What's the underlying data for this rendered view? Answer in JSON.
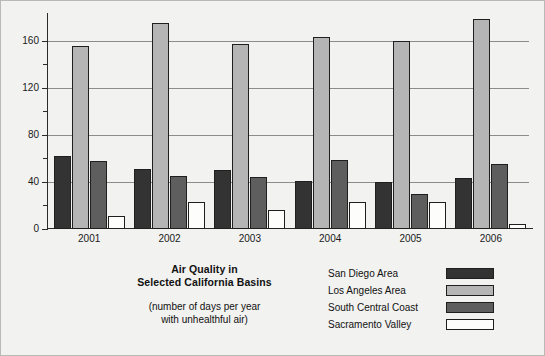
{
  "chart_data": {
    "type": "bar",
    "title": "Air Quality in Selected California Basins",
    "title_line_1": "Air Quality in",
    "title_line_2": "Selected California Basins",
    "subtitle_line_1": "(number of days per year",
    "subtitle_line_2": "with unhealthful air)",
    "xlabel": "",
    "ylabel": "",
    "categories": [
      "2001",
      "2002",
      "2003",
      "2004",
      "2005",
      "2006"
    ],
    "series": [
      {
        "name": "San Diego Area",
        "color": "#333333",
        "values": [
          62,
          51,
          50,
          41,
          40,
          43
        ]
      },
      {
        "name": "Los Angeles Area",
        "color": "#b5b5b5",
        "values": [
          155,
          175,
          157,
          163,
          160,
          178
        ]
      },
      {
        "name": "South Central Coast",
        "color": "#5e5e5e",
        "values": [
          58,
          45,
          44,
          59,
          30,
          55
        ]
      },
      {
        "name": "Sacramento Valley",
        "color": "#fdfdfb",
        "values": [
          11,
          23,
          16,
          23,
          23,
          4
        ]
      }
    ],
    "ylim": [
      0,
      180
    ],
    "ytick_major": [
      0,
      40,
      80,
      120,
      160
    ],
    "ytick_minor": [
      20,
      60,
      100,
      140
    ],
    "grid": true,
    "grid_axis": "y",
    "legend_position": "bottom-right"
  },
  "legend": {
    "items": [
      {
        "label": "San Diego Area"
      },
      {
        "label": "Los Angeles Area"
      },
      {
        "label": "South Central Coast"
      },
      {
        "label": "Sacramento Valley"
      }
    ]
  }
}
